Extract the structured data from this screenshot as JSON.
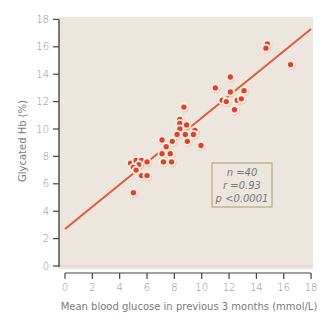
{
  "chart_data": {
    "type": "scatter",
    "title": "",
    "xlabel": "Mean blood glucose in previous 3 months (mmol/L)",
    "ylabel": "Glycated Hb (%)",
    "xlim": [
      0,
      18
    ],
    "ylim": [
      0,
      18
    ],
    "xticks": [
      0,
      2,
      4,
      6,
      8,
      10,
      12,
      14,
      16,
      18
    ],
    "yticks": [
      0,
      2,
      4,
      6,
      8,
      10,
      12,
      14,
      16,
      18
    ],
    "grid": false,
    "legend": null,
    "background_color": "#ece6df",
    "marker_color": "#d9452b",
    "marker_edge_color": "#fbefe4",
    "line_color": "#e05a3a",
    "series": [
      {
        "name": "patients",
        "points": [
          [
            4.8,
            7.5
          ],
          [
            5.2,
            7.7
          ],
          [
            5.6,
            7.7
          ],
          [
            6.0,
            7.6
          ],
          [
            5.4,
            7.4
          ],
          [
            5.0,
            7.2
          ],
          [
            5.2,
            7.0
          ],
          [
            5.6,
            6.6
          ],
          [
            6.0,
            6.6
          ],
          [
            5.0,
            5.35
          ],
          [
            8.7,
            11.6
          ],
          [
            8.4,
            10.7
          ],
          [
            8.4,
            10.4
          ],
          [
            8.9,
            10.3
          ],
          [
            8.4,
            10.0
          ],
          [
            8.2,
            9.6
          ],
          [
            8.8,
            9.6
          ],
          [
            9.5,
            9.9
          ],
          [
            9.4,
            9.6
          ],
          [
            7.85,
            9.1
          ],
          [
            8.95,
            9.1
          ],
          [
            9.95,
            8.8
          ],
          [
            7.1,
            9.2
          ],
          [
            7.4,
            8.7
          ],
          [
            7.1,
            8.2
          ],
          [
            7.7,
            8.2
          ],
          [
            7.2,
            7.6
          ],
          [
            7.8,
            7.6
          ],
          [
            14.8,
            16.2
          ],
          [
            14.7,
            15.9
          ],
          [
            16.5,
            14.7
          ],
          [
            12.1,
            13.8
          ],
          [
            11.0,
            13.0
          ],
          [
            12.1,
            12.7
          ],
          [
            13.1,
            12.8
          ],
          [
            11.5,
            12.1
          ],
          [
            11.8,
            12.0
          ],
          [
            12.6,
            12.1
          ],
          [
            12.9,
            12.2
          ],
          [
            12.4,
            11.4
          ]
        ]
      }
    ],
    "regression_line": {
      "x": [
        0,
        18
      ],
      "y": [
        2.7,
        17.3
      ]
    },
    "annotations": [
      "n =40",
      "r =0.93",
      "p <0.0001"
    ]
  },
  "annotation_box": {
    "line1": "n =40",
    "line2": "r =0.93",
    "line3": "p <0.0001"
  },
  "axes": {
    "xlabel": "Mean blood glucose in previous 3 months (mmol/L)",
    "ylabel": "Glycated Hb (%)"
  }
}
